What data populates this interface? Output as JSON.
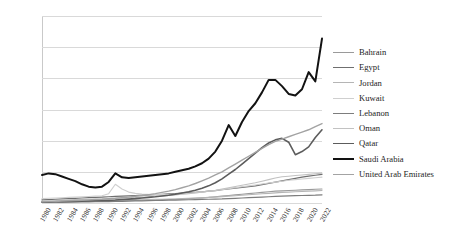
{
  "chart_data": {
    "type": "line",
    "title": "",
    "xlabel": "",
    "ylabel": "",
    "ylim": [
      0,
      1200
    ],
    "ytick_step": 200,
    "yticks": [
      "0",
      "200",
      "400",
      "600",
      "800",
      "1000",
      "1200"
    ],
    "grid": true,
    "legend_position": "right",
    "x": [
      1980,
      1981,
      1982,
      1983,
      1984,
      1985,
      1986,
      1987,
      1988,
      1989,
      1990,
      1991,
      1992,
      1993,
      1994,
      1995,
      1996,
      1997,
      1998,
      1999,
      2000,
      2001,
      2002,
      2003,
      2004,
      2005,
      2006,
      2007,
      2008,
      2009,
      2010,
      2011,
      2012,
      2013,
      2014,
      2015,
      2016,
      2017,
      2018,
      2019,
      2020,
      2021,
      2022
    ],
    "xticks": [
      "1980",
      "1982",
      "1984",
      "1986",
      "1988",
      "1990",
      "1992",
      "1994",
      "1996",
      "1998",
      "2000",
      "2002",
      "2004",
      "2006",
      "2008",
      "2010",
      "2012",
      "2014",
      "2016",
      "2018",
      "2020",
      "2022"
    ],
    "series": [
      {
        "name": "Bahrain",
        "color": "#9a9a9a",
        "width": 1.1,
        "values": [
          5,
          6,
          7,
          8,
          9,
          10,
          10,
          11,
          11,
          12,
          13,
          14,
          15,
          16,
          17,
          18,
          19,
          20,
          21,
          22,
          24,
          26,
          28,
          30,
          33,
          36,
          40,
          44,
          48,
          52,
          56,
          60,
          64,
          68,
          72,
          76,
          78,
          80,
          82,
          84,
          86,
          88,
          90
        ]
      },
      {
        "name": "Egypt",
        "color": "#6f6f6f",
        "width": 1.2,
        "values": [
          20,
          22,
          24,
          26,
          28,
          30,
          32,
          34,
          36,
          38,
          40,
          42,
          44,
          46,
          48,
          50,
          52,
          54,
          56,
          58,
          60,
          63,
          66,
          69,
          72,
          76,
          80,
          85,
          90,
          95,
          100,
          105,
          110,
          118,
          126,
          134,
          142,
          150,
          158,
          166,
          172,
          178,
          184
        ]
      },
      {
        "name": "Jordan",
        "color": "#b5b5b5",
        "width": 1.1,
        "values": [
          8,
          9,
          10,
          11,
          12,
          13,
          13,
          14,
          14,
          15,
          16,
          17,
          18,
          19,
          20,
          21,
          22,
          23,
          24,
          25,
          26,
          28,
          30,
          32,
          34,
          36,
          38,
          41,
          44,
          47,
          50,
          53,
          56,
          59,
          62,
          65,
          68,
          70,
          72,
          74,
          76,
          78,
          80
        ]
      },
      {
        "name": "Kuwait",
        "color": "#cfcfcf",
        "width": 1.1,
        "values": [
          28,
          30,
          32,
          34,
          36,
          38,
          40,
          42,
          44,
          46,
          60,
          120,
          90,
          70,
          62,
          58,
          56,
          55,
          54,
          54,
          55,
          58,
          62,
          66,
          70,
          75,
          80,
          86,
          92,
          98,
          104,
          110,
          116,
          122,
          128,
          134,
          140,
          146,
          150,
          154,
          158,
          162,
          166
        ]
      },
      {
        "name": "Lebanon",
        "color": "#7d7d7d",
        "width": 1.2,
        "values": [
          4,
          4,
          5,
          5,
          6,
          6,
          7,
          7,
          8,
          8,
          9,
          10,
          11,
          12,
          13,
          14,
          15,
          16,
          17,
          18,
          19,
          20,
          21,
          22,
          23,
          24,
          25,
          26,
          28,
          30,
          32,
          34,
          36,
          38,
          40,
          42,
          44,
          46,
          47,
          48,
          49,
          50,
          52
        ]
      },
      {
        "name": "Oman",
        "color": "#c2c2c2",
        "width": 1.1,
        "values": [
          12,
          14,
          16,
          18,
          20,
          22,
          23,
          24,
          25,
          26,
          28,
          30,
          32,
          34,
          36,
          38,
          40,
          43,
          46,
          49,
          52,
          56,
          60,
          65,
          70,
          76,
          82,
          90,
          98,
          106,
          114,
          122,
          130,
          140,
          150,
          160,
          168,
          172,
          176,
          180,
          184,
          188,
          192
        ]
      },
      {
        "name": "Qatar",
        "color": "#5c5c5c",
        "width": 1.6,
        "values": [
          6,
          7,
          8,
          9,
          10,
          11,
          12,
          13,
          14,
          15,
          17,
          19,
          22,
          25,
          28,
          32,
          36,
          40,
          45,
          50,
          56,
          64,
          72,
          82,
          95,
          110,
          130,
          155,
          185,
          215,
          250,
          285,
          320,
          355,
          385,
          405,
          415,
          390,
          310,
          330,
          360,
          420,
          470
        ]
      },
      {
        "name": "Saudi Arabia",
        "color": "#121212",
        "width": 2.0,
        "values": [
          180,
          190,
          185,
          170,
          155,
          140,
          120,
          105,
          100,
          105,
          135,
          190,
          165,
          160,
          165,
          170,
          175,
          180,
          185,
          190,
          200,
          210,
          220,
          235,
          255,
          285,
          330,
          400,
          500,
          430,
          520,
          590,
          640,
          710,
          790,
          790,
          750,
          700,
          690,
          730,
          840,
          780,
          1055
        ]
      },
      {
        "name": "United Arab Emirates",
        "color": "#a3a3a3",
        "width": 1.4,
        "values": [
          8,
          9,
          10,
          12,
          14,
          16,
          18,
          20,
          22,
          24,
          27,
          30,
          34,
          38,
          43,
          48,
          54,
          60,
          68,
          76,
          86,
          98,
          110,
          125,
          142,
          160,
          180,
          200,
          225,
          250,
          275,
          300,
          325,
          350,
          375,
          395,
          410,
          425,
          440,
          455,
          470,
          490,
          510
        ]
      }
    ]
  }
}
